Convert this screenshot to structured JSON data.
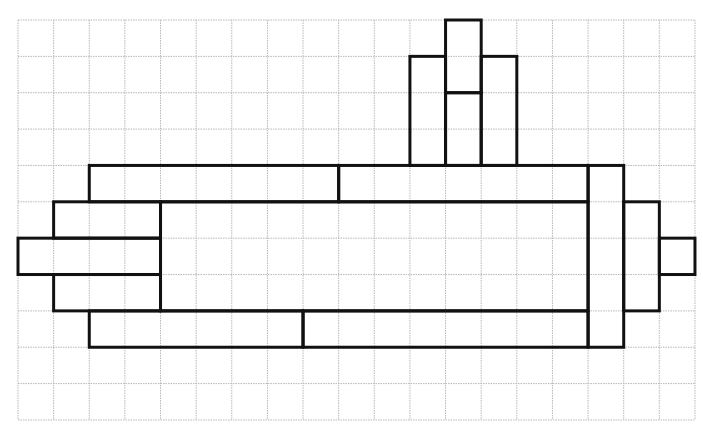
{
  "diagram": {
    "type": "grid-drawing",
    "grid": {
      "columns": 19,
      "rows": 11,
      "origin_px": [
        18,
        20
      ],
      "cell_width_px": 35.63,
      "cell_height_px": 36.36,
      "line_color": "#b8b8b8",
      "line_style": "dotted"
    },
    "outline": {
      "stroke_color": "#111111",
      "stroke_width": 3
    },
    "rectangles": [
      {
        "name": "tower-center-top",
        "col": 12,
        "row": 0,
        "w": 1,
        "h": 2
      },
      {
        "name": "tower-center-bottom",
        "col": 12,
        "row": 2,
        "w": 1,
        "h": 2
      },
      {
        "name": "tower-left",
        "col": 11,
        "row": 1,
        "w": 1,
        "h": 3
      },
      {
        "name": "tower-right",
        "col": 13,
        "row": 1,
        "w": 1,
        "h": 3
      },
      {
        "name": "top-bar-left",
        "col": 2,
        "row": 4,
        "w": 7,
        "h": 1
      },
      {
        "name": "top-bar-right",
        "col": 9,
        "row": 4,
        "w": 7,
        "h": 1
      },
      {
        "name": "main-body",
        "col": 4,
        "row": 5,
        "w": 12,
        "h": 3
      },
      {
        "name": "left-block-top",
        "col": 1,
        "row": 5,
        "w": 3,
        "h": 1
      },
      {
        "name": "left-nose",
        "col": 0,
        "row": 6,
        "w": 4,
        "h": 1
      },
      {
        "name": "left-block-bottom",
        "col": 1,
        "row": 7,
        "w": 3,
        "h": 1
      },
      {
        "name": "bottom-bar-left",
        "col": 2,
        "row": 8,
        "w": 6,
        "h": 1
      },
      {
        "name": "bottom-bar-right",
        "col": 8,
        "row": 8,
        "w": 8,
        "h": 1
      },
      {
        "name": "right-column",
        "col": 16,
        "row": 4,
        "w": 1,
        "h": 5
      },
      {
        "name": "right-block",
        "col": 17,
        "row": 5,
        "w": 1,
        "h": 3
      },
      {
        "name": "right-nib",
        "col": 18,
        "row": 6,
        "w": 1,
        "h": 1
      }
    ]
  }
}
